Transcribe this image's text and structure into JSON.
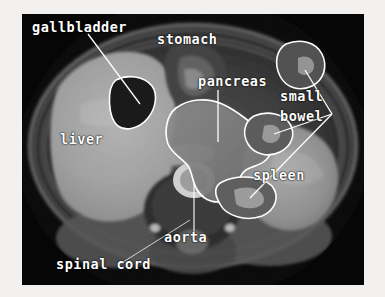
{
  "image": {
    "kind": "axial-abdominal-mri",
    "modality_note": "T1-weighted axial abdominal MR image with organ annotations",
    "frame": {
      "x": 22,
      "y": 14,
      "width": 342,
      "height": 271
    },
    "background_color": "#f2f1ef",
    "scan_background_color": "#050505",
    "annotation_color": "#ffffff"
  },
  "annotations": {
    "gallbladder": {
      "label": "gallbladder",
      "x": 10,
      "y": 6
    },
    "stomach": {
      "label": "stomach",
      "x": 135,
      "y": 18
    },
    "pancreas": {
      "label": "pancreas",
      "x": 176,
      "y": 60
    },
    "small": {
      "label": "small",
      "x": 258,
      "y": 75
    },
    "bowel": {
      "label": "bowel",
      "x": 258,
      "y": 95
    },
    "liver": {
      "label": "liver",
      "x": 38,
      "y": 118
    },
    "spleen": {
      "label": "spleen",
      "x": 231,
      "y": 154
    },
    "aorta": {
      "label": "aorta",
      "x": 142,
      "y": 216
    },
    "spinal_cord": {
      "label": "spinal cord",
      "x": 34,
      "y": 243
    }
  },
  "structures": [
    {
      "name": "gallbladder",
      "outlined": true
    },
    {
      "name": "pancreas",
      "outlined": true
    },
    {
      "name": "small-bowel-upper-loop",
      "outlined": true
    },
    {
      "name": "small-bowel-middle-loop",
      "outlined": true
    },
    {
      "name": "small-bowel-lower-loop",
      "outlined": true
    },
    {
      "name": "liver",
      "outlined": false
    },
    {
      "name": "spleen",
      "outlined": false
    },
    {
      "name": "stomach",
      "outlined": false
    },
    {
      "name": "aorta",
      "outlined": false
    },
    {
      "name": "spinal cord",
      "outlined": false
    }
  ]
}
